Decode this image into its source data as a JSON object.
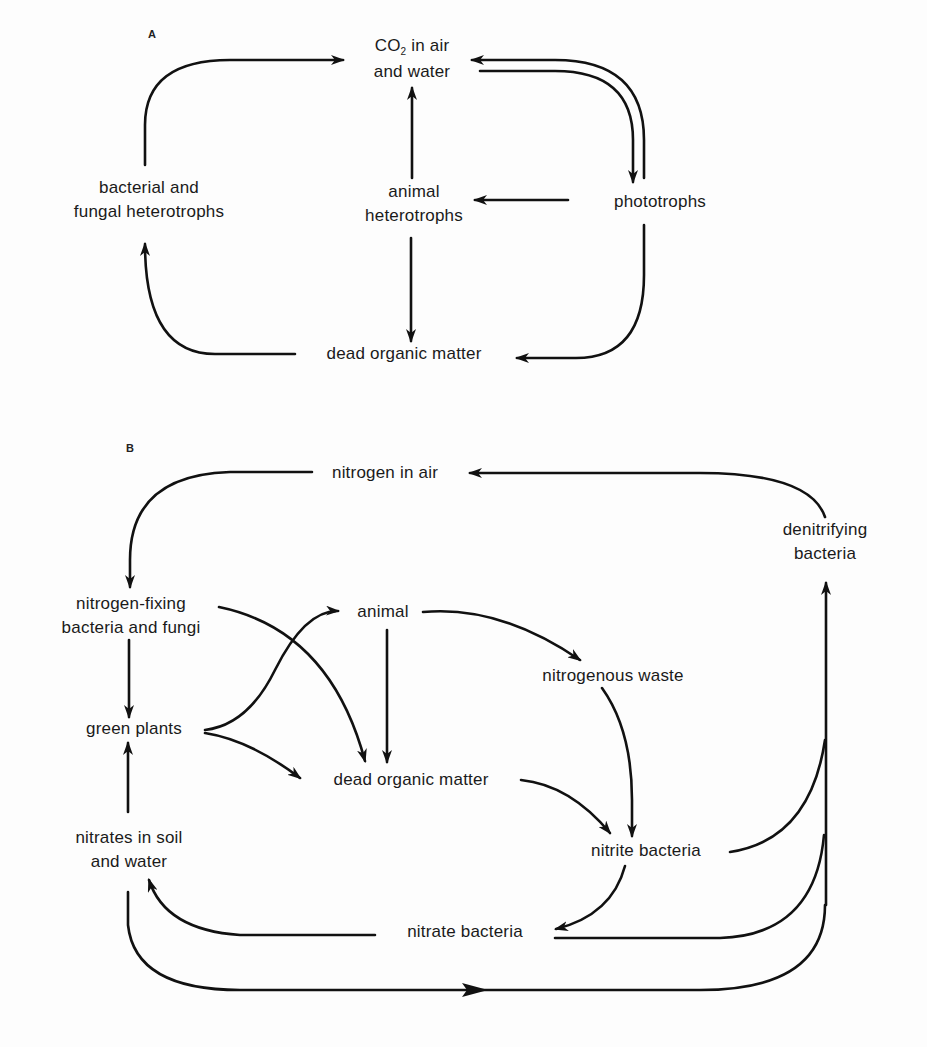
{
  "figure": {
    "panel_a": {
      "letter": "A",
      "nodes": {
        "co2_line1": "in air",
        "co2_prefix": "CO",
        "co2_sub": "2",
        "co2_line2": "and water",
        "bacterial_line1": "bacterial and",
        "bacterial_line2": "fungal heterotrophs",
        "animal_line1": "animal",
        "animal_line2": "heterotrophs",
        "phototrophs": "phototrophs",
        "dead_organic": "dead organic matter"
      },
      "edges": [
        {
          "from": "bacterial and fungal heterotrophs",
          "to": "CO2 in air and water"
        },
        {
          "from": "animal heterotrophs",
          "to": "CO2 in air and water"
        },
        {
          "from": "phototrophs",
          "to": "CO2 in air and water"
        },
        {
          "from": "CO2 in air and water",
          "to": "phototrophs"
        },
        {
          "from": "phototrophs",
          "to": "animal heterotrophs"
        },
        {
          "from": "animal heterotrophs",
          "to": "dead organic matter"
        },
        {
          "from": "phototrophs",
          "to": "dead organic matter"
        },
        {
          "from": "dead organic matter",
          "to": "bacterial and fungal heterotrophs"
        }
      ]
    },
    "panel_b": {
      "letter": "B",
      "nodes": {
        "nitrogen_air": "nitrogen in air",
        "denitrifying_line1": "denitrifying",
        "denitrifying_line2": "bacteria",
        "nfixing_line1": "nitrogen-fixing",
        "nfixing_line2": "bacteria and fungi",
        "animal": "animal",
        "nitrogenous_waste": "nitrogenous waste",
        "green_plants": "green plants",
        "dead_organic": "dead organic matter",
        "nitrates_line1": "nitrates in soil",
        "nitrates_line2": "and water",
        "nitrite_bacteria": "nitrite bacteria",
        "nitrate_bacteria": "nitrate bacteria"
      },
      "edges": [
        {
          "from": "nitrogen in air",
          "to": "nitrogen-fixing bacteria and fungi"
        },
        {
          "from": "denitrifying bacteria",
          "to": "nitrogen in air"
        },
        {
          "from": "nitrogen-fixing bacteria and fungi",
          "to": "green plants"
        },
        {
          "from": "nitrogen-fixing bacteria and fungi",
          "to": "dead organic matter"
        },
        {
          "from": "green plants",
          "to": "animal"
        },
        {
          "from": "green plants",
          "to": "dead organic matter"
        },
        {
          "from": "animal",
          "to": "dead organic matter"
        },
        {
          "from": "animal",
          "to": "nitrogenous waste"
        },
        {
          "from": "nitrogenous waste",
          "to": "nitrite bacteria"
        },
        {
          "from": "dead organic matter",
          "to": "nitrite bacteria"
        },
        {
          "from": "nitrite bacteria",
          "to": "nitrate bacteria"
        },
        {
          "from": "nitrite bacteria",
          "to": "denitrifying bacteria"
        },
        {
          "from": "nitrate bacteria",
          "to": "nitrates in soil and water"
        },
        {
          "from": "nitrate bacteria",
          "to": "denitrifying bacteria"
        },
        {
          "from": "nitrates in soil and water",
          "to": "green plants"
        },
        {
          "from": "nitrates in soil and water",
          "to": "denitrifying bacteria"
        }
      ]
    }
  }
}
